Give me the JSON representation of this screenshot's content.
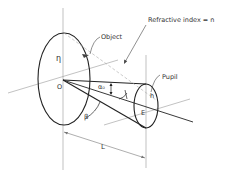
{
  "diagram": {
    "type": "optical-geometry",
    "labels": {
      "refractive_index": "Refractive  index = n",
      "object": "Object",
      "pupil": "Pupil",
      "eta": "η",
      "origin": "O",
      "alpha0": "α₀",
      "beta": "β",
      "h": "h",
      "E": "E",
      "L": "L"
    },
    "colors": {
      "stroke": "#222222",
      "thin": "#888888",
      "dashed": "#aaaaaa"
    }
  }
}
